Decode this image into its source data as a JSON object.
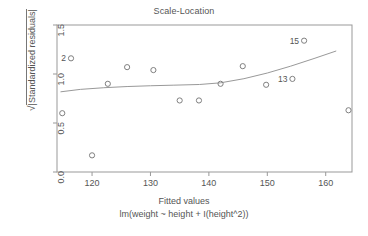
{
  "chart_data": {
    "type": "scatter",
    "title": "Scale-Location",
    "xlabel": "Fitted values",
    "sublabel": "lm(weight ~ height + I(height^2))",
    "ylabel": "|Standardized residuals|",
    "ylabel_prefix": "√",
    "xlim": [
      114.0,
      164.5
    ],
    "ylim": [
      0.0,
      1.5
    ],
    "grid": false,
    "legend": "none",
    "xticks": [
      120,
      130,
      140,
      150,
      160
    ],
    "xtick_labels": [
      "120",
      "130",
      "140",
      "150",
      "160"
    ],
    "yticks": [
      0.0,
      0.5,
      1.0,
      1.5
    ],
    "ytick_labels": [
      "0.0",
      "0.5",
      "1.0",
      "1.5"
    ],
    "marker": "open-circle",
    "points": [
      {
        "x": 114.9,
        "y": 0.6,
        "label": ""
      },
      {
        "x": 116.4,
        "y": 1.16,
        "label": "2"
      },
      {
        "x": 120.0,
        "y": 0.17,
        "label": ""
      },
      {
        "x": 122.7,
        "y": 0.9,
        "label": ""
      },
      {
        "x": 126.0,
        "y": 1.07,
        "label": ""
      },
      {
        "x": 130.5,
        "y": 1.04,
        "label": ""
      },
      {
        "x": 135.0,
        "y": 0.73,
        "label": ""
      },
      {
        "x": 138.3,
        "y": 0.73,
        "label": ""
      },
      {
        "x": 142.0,
        "y": 0.9,
        "label": ""
      },
      {
        "x": 145.8,
        "y": 1.08,
        "label": ""
      },
      {
        "x": 149.8,
        "y": 0.89,
        "label": ""
      },
      {
        "x": 154.3,
        "y": 0.95,
        "label": "13"
      },
      {
        "x": 156.3,
        "y": 1.34,
        "label": "15"
      },
      {
        "x": 163.9,
        "y": 0.63,
        "label": ""
      }
    ],
    "smoother": {
      "name": "lowess",
      "x": [
        114.6,
        118.0,
        122.0,
        126.0,
        130.0,
        134.0,
        138.4,
        142.0,
        146.0,
        150.0,
        154.0,
        158.0,
        161.8
      ],
      "y": [
        0.818,
        0.843,
        0.86,
        0.872,
        0.88,
        0.886,
        0.893,
        0.91,
        0.952,
        1.01,
        1.08,
        1.158,
        1.235
      ]
    },
    "colors": {
      "axis": "#999999",
      "marker": "#808080",
      "line": "#999999",
      "text": "#555555",
      "background": "#ffffff"
    }
  }
}
